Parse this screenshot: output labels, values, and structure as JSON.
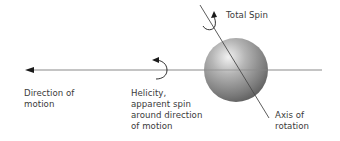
{
  "diagram": {
    "colors": {
      "motion_line": "#8a8a8a",
      "axis_line": "#4a4a4a",
      "arrow": "#1a1a1a",
      "sphere_light": "#e8e8e8",
      "sphere_mid": "#9a9a9a",
      "sphere_dark": "#5a5a5a",
      "text": "#3a3a3a"
    },
    "labels": {
      "total_spin": "Total Spin",
      "direction_of_motion": "Direction of\nmotion",
      "helicity": "Helicity,\napparent spin\naround direction\nof motion",
      "axis_of_rotation": "Axis of\nrotation"
    },
    "elements": [
      {
        "id": "motion-line",
        "type": "arrow-line",
        "direction": "left"
      },
      {
        "id": "particle-sphere",
        "type": "sphere"
      },
      {
        "id": "rotation-axis",
        "type": "line"
      },
      {
        "id": "total-spin-arrow",
        "type": "curved-arrow"
      },
      {
        "id": "helicity-arrow",
        "type": "curved-arrow"
      }
    ]
  }
}
